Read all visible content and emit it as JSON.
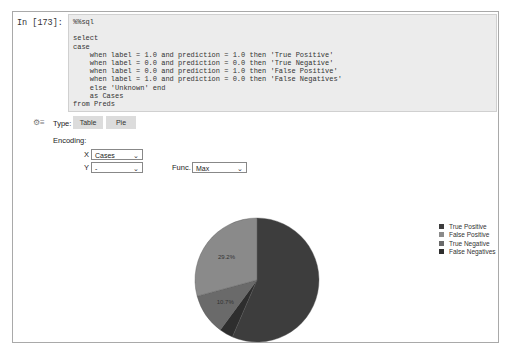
{
  "cell": {
    "prompt": "In [173]:",
    "code_lines": [
      "%%sql",
      "",
      "select",
      "case",
      "    when label = 1.0 and prediction = 1.0 then 'True Positive'",
      "    when label = 0.0 and prediction = 0.0 then 'True Negative'",
      "    when label = 0.0 and prediction = 1.0 then 'False Positive'",
      "    when label = 1.0 and prediction = 0.0 then 'False Negatives'",
      "    else 'Unknown' end",
      "    as Cases",
      "from Preds"
    ]
  },
  "controls": {
    "settings_icon": "gear-icon",
    "type_label": "Type:",
    "type_buttons": [
      "Table",
      "Pie"
    ],
    "encoding_label": "Encoding:",
    "x_label": "X",
    "x_value": "Cases",
    "y_label": "Y",
    "y_value": "-",
    "func_label": "Func.",
    "func_value": "Max"
  },
  "chart_data": {
    "type": "pie",
    "title": "",
    "categories": [
      "True Positive",
      "False Positive",
      "True Negative",
      "False Negatives"
    ],
    "values": [
      56.5,
      29.2,
      10.7,
      3.6
    ],
    "labels_shown": [
      "",
      "29.2%",
      "10.7%",
      ""
    ],
    "colors": [
      "#3d3d3d",
      "#8a8a8a",
      "#6a6a6a",
      "#2e2e2e"
    ],
    "legend_position": "right"
  },
  "legend": {
    "items": [
      {
        "label": "True Positive",
        "color": "#3d3d3d"
      },
      {
        "label": "False Positive",
        "color": "#8a8a8a"
      },
      {
        "label": "True Negative",
        "color": "#6a6a6a"
      },
      {
        "label": "False Negatives",
        "color": "#2e2e2e"
      }
    ]
  },
  "pie_labels": {
    "fp": "29.2%",
    "tn": "10.7%"
  }
}
